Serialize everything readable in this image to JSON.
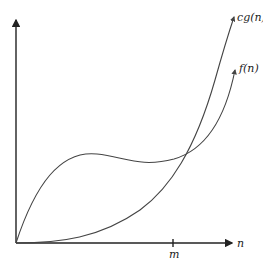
{
  "figure": {
    "title": "",
    "curves": [
      {
        "name": "cg",
        "label": "cg(n)"
      },
      {
        "name": "f",
        "label": "f(n)"
      }
    ],
    "axes": {
      "x_label": "n",
      "tick_label": "m"
    },
    "colors": {
      "axis": "#222222",
      "curve": "#444444"
    }
  }
}
